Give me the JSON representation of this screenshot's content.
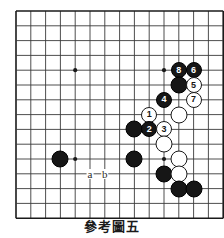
{
  "diagram": {
    "caption": "參考圖五",
    "board": {
      "cols": 14,
      "rows": 14,
      "spacing": 14.8,
      "origin_x": 15,
      "origin_y": 10,
      "line_color": "#3a3a3a",
      "border_color": "#1a1a1a",
      "background": "#ffffff",
      "star_points": [
        {
          "col": 4,
          "row": 4
        },
        {
          "col": 10,
          "row": 4
        },
        {
          "col": 4,
          "row": 10
        },
        {
          "col": 10,
          "row": 10
        }
      ]
    },
    "colors": {
      "black_stone": "#161616",
      "white_stone": "#ffffff",
      "black_label": "#ffffff",
      "white_label": "#161616"
    },
    "stones": [
      {
        "id": "black-8",
        "color": "black",
        "label": "8",
        "col": 11,
        "row": 4
      },
      {
        "id": "black-6",
        "color": "black",
        "label": "6",
        "col": 12,
        "row": 4
      },
      {
        "id": "black-plain-a",
        "color": "black",
        "label": "",
        "col": 11,
        "row": 5
      },
      {
        "id": "white-5",
        "color": "white",
        "label": "5",
        "col": 12,
        "row": 5
      },
      {
        "id": "black-4",
        "color": "black",
        "label": "4",
        "col": 10,
        "row": 6
      },
      {
        "id": "white-7",
        "color": "white",
        "label": "7",
        "col": 12,
        "row": 6
      },
      {
        "id": "white-1",
        "color": "white",
        "label": "1",
        "col": 9,
        "row": 7
      },
      {
        "id": "white-plain-a",
        "color": "white",
        "label": "",
        "col": 11,
        "row": 7
      },
      {
        "id": "black-plain-b",
        "color": "black",
        "label": "",
        "col": 8,
        "row": 8
      },
      {
        "id": "black-2",
        "color": "black",
        "label": "2",
        "col": 9,
        "row": 8
      },
      {
        "id": "white-3",
        "color": "white",
        "label": "3",
        "col": 10,
        "row": 8
      },
      {
        "id": "white-plain-b",
        "color": "white",
        "label": "",
        "col": 10,
        "row": 9
      },
      {
        "id": "black-plain-c",
        "color": "black",
        "label": "",
        "col": 3,
        "row": 10
      },
      {
        "id": "black-plain-d",
        "color": "black",
        "label": "",
        "col": 8,
        "row": 10
      },
      {
        "id": "white-plain-c",
        "color": "white",
        "label": "",
        "col": 11,
        "row": 10
      },
      {
        "id": "black-plain-e",
        "color": "black",
        "label": "",
        "col": 10,
        "row": 11
      },
      {
        "id": "white-plain-d",
        "color": "white",
        "label": "",
        "col": 11,
        "row": 11
      },
      {
        "id": "black-plain-f",
        "color": "black",
        "label": "",
        "col": 11,
        "row": 12
      },
      {
        "id": "black-plain-g",
        "color": "black",
        "label": "",
        "col": 12,
        "row": 12
      }
    ],
    "point_markers": [
      {
        "id": "marker-a",
        "label": "a",
        "col": 5,
        "row": 11
      },
      {
        "id": "marker-b",
        "label": "b",
        "col": 6,
        "row": 11
      }
    ]
  }
}
